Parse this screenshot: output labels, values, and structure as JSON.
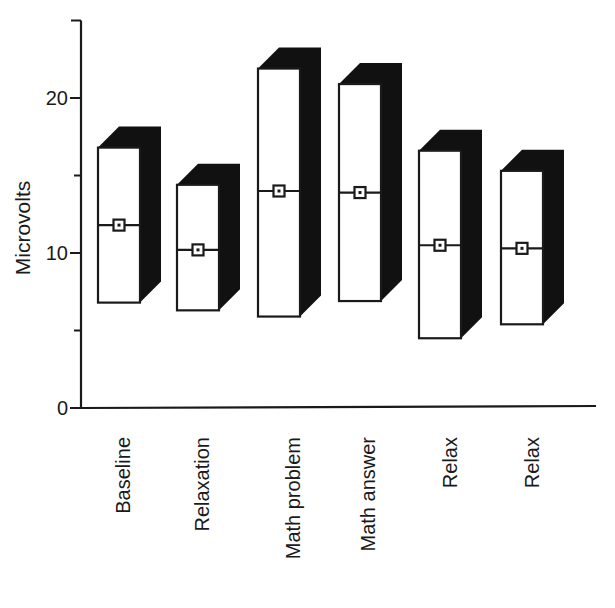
{
  "chart_data": {
    "type": "bar",
    "subtype": "floating-range-3d-with-mean-marker",
    "title": "",
    "xlabel": "",
    "ylabel": "Microvolts",
    "ylim": [
      0,
      25
    ],
    "yticks": [
      0,
      5,
      10,
      15,
      20,
      25
    ],
    "ytick_labels": [
      "0",
      "",
      "10",
      "",
      "20",
      ""
    ],
    "grid": false,
    "legend": null,
    "categories": [
      "Baseline",
      "Relaxation",
      "Math problem",
      "Math answer",
      "Relax",
      "Relax"
    ],
    "series": [
      {
        "name": "range_low",
        "values": [
          6.8,
          6.3,
          5.9,
          6.9,
          4.5,
          5.4
        ]
      },
      {
        "name": "range_high",
        "values": [
          16.8,
          14.4,
          21.9,
          20.9,
          16.6,
          15.3
        ]
      },
      {
        "name": "mean",
        "values": [
          11.8,
          10.2,
          14.0,
          13.9,
          10.5,
          10.3
        ]
      }
    ],
    "colors": {
      "front_face": "#ffffff",
      "side_face": "#111111",
      "outline": "#1a1a1a",
      "axis": "#1a1a1a"
    }
  }
}
